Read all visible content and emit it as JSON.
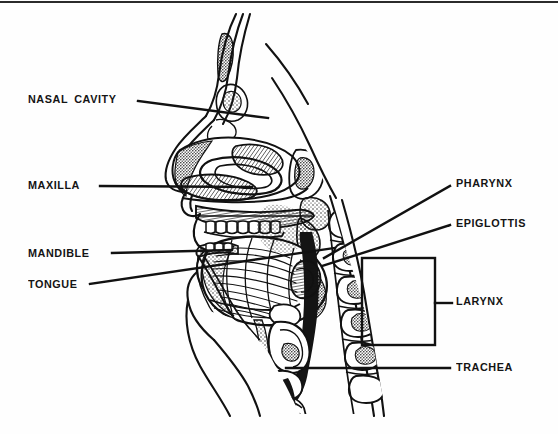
{
  "figure": {
    "style": "black-and-white line engraving",
    "border": {
      "top_rule": true,
      "color": "#2b2b2b"
    }
  },
  "labels": [
    {
      "id": "nasal-cavity",
      "text": "NASAL CAVITY",
      "side": "left",
      "x": 28,
      "y": 94,
      "leader": {
        "from": [
          138,
          101
        ],
        "to": [
          268,
          118
        ]
      }
    },
    {
      "id": "maxilla",
      "text": "MAXILLA",
      "side": "left",
      "x": 28,
      "y": 180,
      "leader": {
        "from": [
          100,
          186
        ],
        "to": [
          252,
          187
        ]
      }
    },
    {
      "id": "mandible",
      "text": "MANDIBLE",
      "side": "left",
      "x": 28,
      "y": 248,
      "leader": {
        "from": [
          112,
          253
        ],
        "to": [
          232,
          250
        ]
      }
    },
    {
      "id": "tongue",
      "text": "TONGUE",
      "side": "left",
      "x": 28,
      "y": 279,
      "leader": {
        "from": [
          90,
          284
        ],
        "to": [
          334,
          248
        ]
      }
    },
    {
      "id": "pharynx",
      "text": "PHARYNX",
      "side": "right",
      "x": 456,
      "y": 178,
      "leader": {
        "from": [
          450,
          186
        ],
        "to": [
          324,
          258
        ]
      }
    },
    {
      "id": "epiglottis",
      "text": "EPIGLOTTIS",
      "side": "right",
      "x": 456,
      "y": 218,
      "leader": {
        "from": [
          450,
          225
        ],
        "to": [
          322,
          266
        ]
      }
    },
    {
      "id": "larynx",
      "text": "LARYNX",
      "side": "right",
      "x": 456,
      "y": 302,
      "leader": {
        "type": "bracket",
        "rect": [
          362,
          258,
          435,
          345
        ],
        "tick": [
          435,
          303,
          452,
          303
        ]
      }
    },
    {
      "id": "trachea",
      "text": "TRACHEA",
      "side": "right",
      "x": 456,
      "y": 364,
      "leader": {
        "from": [
          450,
          368
        ],
        "to": [
          286,
          368
        ]
      }
    }
  ],
  "colors": {
    "ink": "#111111",
    "paper": "#fefefe",
    "rule": "#2b2b2b"
  }
}
